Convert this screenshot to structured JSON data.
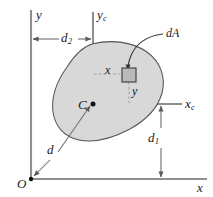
{
  "figure": {
    "colors": {
      "area_fill": "#d8d8d8",
      "area_stroke": "#4a4a4a",
      "axis": "#8a8a8a",
      "dimension": "#6e6e6e",
      "dashed": "#9a9a9a",
      "element_fill": "#b9b9b9",
      "element_stroke": "#3a3a3a",
      "text": "#1a1a1a",
      "background": "#ffffff"
    },
    "axes": [
      {
        "id": "y-axis",
        "label": "y",
        "sub": "",
        "orientation": "vertical",
        "role": "reference-vertical"
      },
      {
        "id": "x-axis",
        "label": "x",
        "sub": "",
        "orientation": "horizontal",
        "role": "reference-horizontal"
      },
      {
        "id": "yc-axis",
        "label": "y",
        "sub": "c",
        "orientation": "vertical",
        "role": "centroidal-vertical"
      },
      {
        "id": "xc-axis",
        "label": "x",
        "sub": "c",
        "orientation": "horizontal",
        "role": "centroidal-horizontal"
      }
    ],
    "points": [
      {
        "id": "origin",
        "label": "O",
        "sub": "",
        "description": "origin of reference axes"
      },
      {
        "id": "centroid",
        "label": "C",
        "sub": "",
        "description": "centroid of area"
      }
    ],
    "dimensions": [
      {
        "id": "d2",
        "label": "d",
        "sub": "2",
        "orientation": "horizontal",
        "description": "horizontal distance from y axis to yc axis"
      },
      {
        "id": "d1",
        "label": "d",
        "sub": "1",
        "orientation": "vertical",
        "description": "vertical distance from x axis to xc axis"
      },
      {
        "id": "d",
        "label": "d",
        "sub": "",
        "orientation": "diagonal",
        "description": "distance from origin O to centroid C"
      }
    ],
    "element": {
      "label": "dA",
      "description": "differential area element",
      "coord_x": {
        "label": "x",
        "sub": "",
        "description": "horizontal distance from yc axis to element"
      },
      "coord_y": {
        "label": "y",
        "sub": "",
        "description": "vertical distance from xc axis to element"
      }
    }
  }
}
